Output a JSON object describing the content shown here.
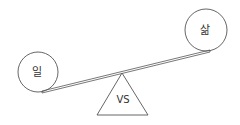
{
  "diagram": {
    "type": "balance-scale",
    "left_weight": {
      "label": "일"
    },
    "right_weight": {
      "label": "삶"
    },
    "fulcrum": {
      "label": "VS"
    },
    "stroke_color": "#555555"
  }
}
